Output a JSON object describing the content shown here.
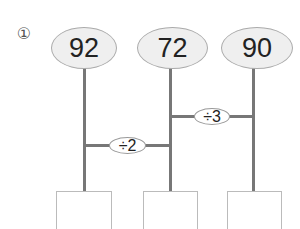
{
  "problem": {
    "number_label": "①",
    "top_numbers": [
      "92",
      "72",
      "90"
    ],
    "operations": [
      {
        "label": "÷2",
        "between": [
          0,
          1
        ]
      },
      {
        "label": "÷3",
        "between": [
          1,
          2
        ]
      }
    ],
    "answer_boxes": [
      "",
      "",
      ""
    ]
  },
  "colors": {
    "line": "#777777",
    "ellipse_fill": "#efefef",
    "ellipse_border": "#aaaaaa",
    "box_border": "#bbbbbb"
  }
}
